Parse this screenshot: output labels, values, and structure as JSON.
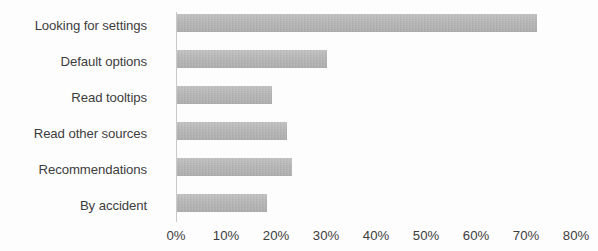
{
  "chart_data": {
    "type": "bar",
    "orientation": "horizontal",
    "title": "",
    "xlabel": "",
    "ylabel": "",
    "categories": [
      "Looking for settings",
      "Default options",
      "Read tooltips",
      "Read other sources",
      "Recommendations",
      "By accident"
    ],
    "values": [
      72,
      30,
      19,
      22,
      23,
      18
    ],
    "value_suffix": "%",
    "xlim": [
      0,
      80
    ],
    "xticks": [
      0,
      10,
      20,
      30,
      40,
      50,
      60,
      70,
      80
    ],
    "xtick_labels": [
      "0%",
      "10%",
      "20%",
      "30%",
      "40%",
      "50%",
      "60%",
      "70%",
      "80%"
    ],
    "grid": false,
    "legend": null,
    "bar_color": "#b5b5b5",
    "axis_color": "#c9c9c9",
    "text_color": "#3d3d3d",
    "background": "#fdfdfd"
  }
}
